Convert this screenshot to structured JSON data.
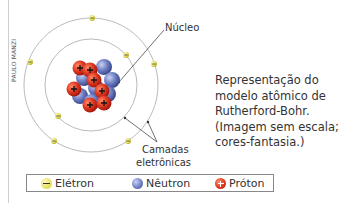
{
  "credit": "PAULO MANZI",
  "labels": {
    "nucleus": "Núcleo",
    "shells_line1": "Camadas",
    "shells_line2": "eletrônicas"
  },
  "caption": {
    "lines": [
      "Representação do",
      "modelo atômico de",
      "Rutherford-Bohr.",
      "(Imagem sem escala;",
      "cores-fantasia.)"
    ]
  },
  "legend": {
    "items": [
      {
        "label": "Elétron",
        "icon": "electron-icon",
        "color": "#e6df5c"
      },
      {
        "label": "Nêutron",
        "icon": "neutron-icon",
        "color": "#5b6db0"
      },
      {
        "label": "Próton",
        "icon": "proton-icon",
        "color": "#d9321f"
      }
    ]
  },
  "colors": {
    "electron": "#e6df5c",
    "neutron": "#6a7dc0",
    "proton": "#d9321f",
    "orbit": "#a0a0a0"
  }
}
